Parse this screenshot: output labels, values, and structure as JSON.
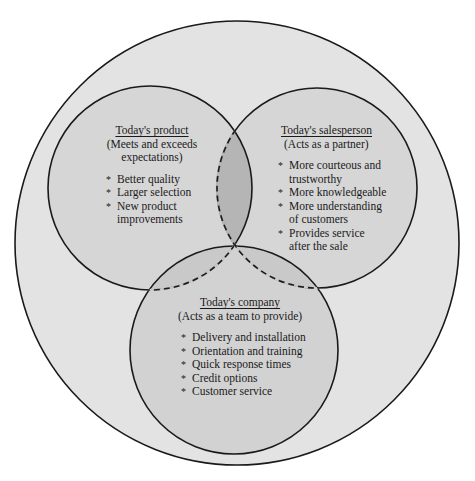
{
  "colors": {
    "background": "#ffffff",
    "outer_fill": "#e3e3e3",
    "circle_fill": "#d6d6d6",
    "company_overlap_fill": "#c9c9c9",
    "product_salesperson_overlap_fill": "#b5b5b5",
    "stroke": "#1a1a1a"
  },
  "geometry": {
    "outer": {
      "cx": 237,
      "cy": 243,
      "r": 222
    },
    "product": {
      "cx": 150,
      "cy": 188,
      "r": 102
    },
    "salesperson": {
      "cx": 317,
      "cy": 188,
      "r": 100
    },
    "company": {
      "cx": 234,
      "cy": 350,
      "r": 104
    }
  },
  "product": {
    "title": "Today's product",
    "subtitle_line1": "(Meets and exceeds",
    "subtitle_line2": "expectations)",
    "items": [
      "Better quality",
      "Larger selection",
      "New product improvements"
    ]
  },
  "salesperson": {
    "title": "Today's salesperson",
    "subtitle": "(Acts as a partner)",
    "items": [
      "More courteous and trustworthy",
      "More knowledgeable",
      "More understanding of customers",
      "Provides service after the sale"
    ]
  },
  "company": {
    "title": "Today's company",
    "subtitle": "(Acts as a team to provide)",
    "items": [
      "Delivery and installation",
      "Orientation and training",
      "Quick response times",
      "Credit options",
      "Customer service"
    ]
  }
}
